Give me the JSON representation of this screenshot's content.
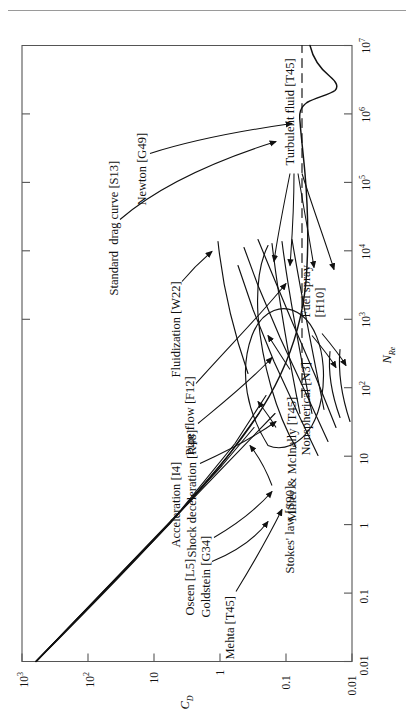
{
  "page": {
    "running_head_faint": "",
    "background": "#ffffff",
    "ink": "#111111"
  },
  "figure": {
    "orientation": "rotated-90-ccw",
    "frame_color": "#555555"
  },
  "chart_data": {
    "type": "line",
    "title": "",
    "xlabel": "N_Re",
    "ylabel": "C_D",
    "xlabel_main": "N",
    "xlabel_sub": "Re",
    "ylabel_main": "C",
    "ylabel_sub": "D",
    "xscale": "log",
    "yscale": "log",
    "xlim": [
      0.01,
      10000000
    ],
    "ylim": [
      0.01,
      1000
    ],
    "grid": false,
    "legend": "none (inline annotations with leader arrows)",
    "xticks": [
      {
        "value": 0.01,
        "label": "0.01"
      },
      {
        "value": 0.1,
        "label": "0.1"
      },
      {
        "value": 1,
        "label": "1"
      },
      {
        "value": 10,
        "label": "10"
      },
      {
        "value": 100,
        "label": "10",
        "exp": "2"
      },
      {
        "value": 1000,
        "label": "10",
        "exp": "3"
      },
      {
        "value": 10000,
        "label": "10",
        "exp": "4"
      },
      {
        "value": 100000,
        "label": "10",
        "exp": "5"
      },
      {
        "value": 1000000,
        "label": "10",
        "exp": "6"
      },
      {
        "value": 10000000,
        "label": "10",
        "exp": "7"
      }
    ],
    "yticks": [
      {
        "value": 0.01,
        "label": "0.01"
      },
      {
        "value": 0.1,
        "label": "0.1"
      },
      {
        "value": 1,
        "label": "1"
      },
      {
        "value": 10,
        "label": "10"
      },
      {
        "value": 100,
        "label": "10",
        "exp": "2"
      },
      {
        "value": 1000,
        "label": "10",
        "exp": "3"
      }
    ],
    "series": [
      {
        "name": "Standard drag curve [S13]",
        "style": "solid",
        "points": [
          [
            0.01,
            2400
          ],
          [
            0.03,
            800
          ],
          [
            0.1,
            240
          ],
          [
            0.3,
            82
          ],
          [
            1,
            26.5
          ],
          [
            3,
            10.5
          ],
          [
            10,
            4.1
          ],
          [
            30,
            2.0
          ],
          [
            100,
            1.09
          ],
          [
            300,
            0.65
          ],
          [
            1000,
            0.46
          ],
          [
            3000,
            0.4
          ],
          [
            10000,
            0.41
          ],
          [
            30000,
            0.44
          ],
          [
            100000,
            0.47
          ],
          [
            250000,
            0.42
          ],
          [
            400000,
            0.16
          ],
          [
            600000,
            0.1
          ],
          [
            1000000,
            0.12
          ],
          [
            3000000,
            0.17
          ],
          [
            10000000,
            0.2
          ]
        ]
      },
      {
        "name": "Newton [G49]",
        "style": "dashed",
        "constant_cd": 0.44,
        "range": [
          600,
          10000000
        ]
      },
      {
        "name": "Stokes' law [S90]",
        "style": "solid-straight",
        "relation": "CD = 24/NRe",
        "range": [
          0.01,
          30
        ]
      },
      {
        "name": "Oseen [L5]",
        "style": "solid",
        "range": [
          0.01,
          20
        ]
      },
      {
        "name": "Goldstein [G34]",
        "style": "solid",
        "range": [
          0.01,
          30
        ]
      },
      {
        "name": "Mehta [T45]",
        "style": "solid",
        "range": [
          0.01,
          20
        ]
      },
      {
        "name": "Miller & McInally [T45]",
        "style": "solid",
        "range": [
          0.5,
          400
        ]
      },
      {
        "name": "Nonspherical [N3]",
        "style": "solid",
        "range": [
          1,
          3000
        ]
      },
      {
        "name": "Acceleration [I4]",
        "style": "solid",
        "range": [
          1,
          2000
        ]
      },
      {
        "name": "Shock deceleration [R48]",
        "style": "solid",
        "range": [
          10,
          3000
        ]
      },
      {
        "name": "Pipe flow [F12]",
        "style": "solid",
        "range": [
          10,
          2000
        ]
      },
      {
        "name": "Fluidization [W22]",
        "style": "solid",
        "range": [
          100,
          3000
        ]
      },
      {
        "name": "Fuel spray [H10]",
        "style": "solid",
        "range": [
          20,
          300
        ]
      },
      {
        "name": "Turbulent fluid [T45]",
        "style": "solid",
        "range": [
          30,
          2000
        ]
      }
    ],
    "annotations": [
      {
        "id": "standard-drag-curve",
        "text": "Standard  drag curve [S13]",
        "lines": [
          "Standard  drag curve [S13]"
        ],
        "leader": true
      },
      {
        "id": "newton",
        "text": "Newton [G49]",
        "lines": [
          "Newton [G49]"
        ],
        "leader": true
      },
      {
        "id": "fluidization",
        "text": "Fluidization [W22]",
        "lines": [
          "Fluidization [W22]"
        ],
        "leader": true
      },
      {
        "id": "pipe-flow",
        "text": "Pipe flow [F12]",
        "lines": [
          "Pipe flow [F12]"
        ],
        "leader": true
      },
      {
        "id": "shock-deceleration",
        "text": "Shock deceleration [R48]",
        "lines": [
          "Shock deceleration [R48]"
        ],
        "leader": true
      },
      {
        "id": "acceleration",
        "text": "Acceleration [I4]",
        "lines": [
          "Acceleration [I4]"
        ],
        "leader": true
      },
      {
        "id": "goldstein",
        "text": "Goldstein [G34]",
        "lines": [
          "Goldstein [G34]"
        ],
        "leader": true
      },
      {
        "id": "oseen",
        "text": "Oseen [L5]",
        "lines": [
          "Oseen [L5]"
        ],
        "leader": true
      },
      {
        "id": "mehta",
        "text": "Mehta [T45]",
        "lines": [
          "Mehta [T45]"
        ],
        "leader": true
      },
      {
        "id": "stokes-law",
        "text": "Stokes' law [S90]",
        "lines": [
          "Stokes' law [S90]"
        ],
        "leader": true
      },
      {
        "id": "miller-mcinally",
        "text": "Miller & McInally [T45]",
        "lines": [
          "Miller & McInally [T45]"
        ],
        "leader": true
      },
      {
        "id": "nonspherical",
        "text": "Nonspherical [N3]",
        "lines": [
          "Nonspherical [N3]"
        ],
        "leader": true
      },
      {
        "id": "fuel-spray",
        "text": "Fuel spray [H10]",
        "lines": [
          "Fuel spray",
          "[H10]"
        ],
        "leader": true
      },
      {
        "id": "turbulent-fluid",
        "text": "Turbulent fluid [T45]",
        "lines": [
          "Turbulent fluid [T45]"
        ],
        "leader": true
      }
    ]
  }
}
